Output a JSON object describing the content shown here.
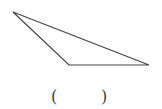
{
  "diagram": {
    "shape": "obtuse triangle",
    "vertices": [
      [
        13,
        12
      ],
      [
        69,
        65
      ],
      [
        149,
        65
      ]
    ],
    "stroke_color": "#444444"
  },
  "answer_blank": {
    "open": "(",
    "close": ")"
  }
}
